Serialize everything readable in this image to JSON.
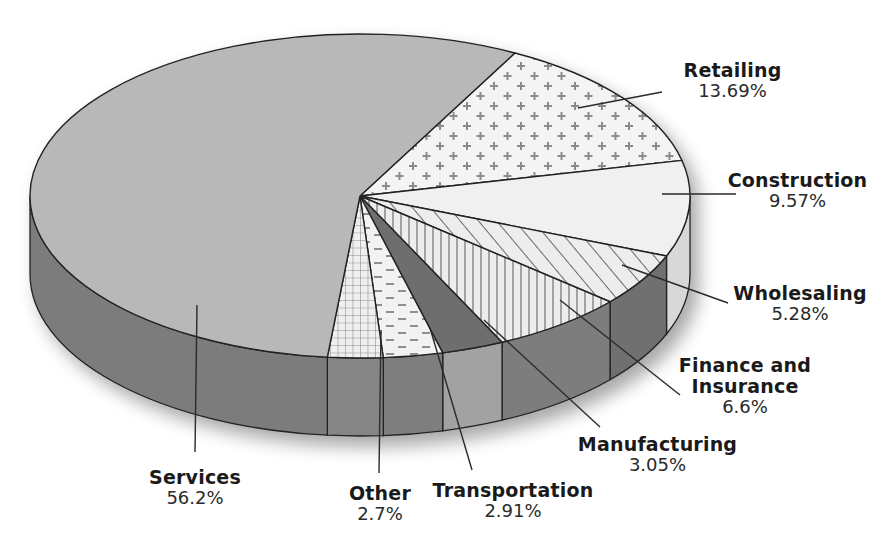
{
  "chart_data": {
    "type": "pie",
    "style": "3d",
    "title": "",
    "categories": [
      "Services",
      "Retailing",
      "Construction",
      "Wholesaling",
      "Finance and Insurance",
      "Manufacturing",
      "Transportation",
      "Other"
    ],
    "values": [
      56.2,
      13.69,
      9.57,
      5.28,
      6.6,
      3.05,
      2.91,
      2.7
    ],
    "value_labels": [
      "56.2%",
      "13.69%",
      "9.57%",
      "5.28%",
      "6.6%",
      "3.05%",
      "2.91%",
      "2.7%"
    ],
    "legend": "none (callout labels)",
    "patterns": {
      "Services": "solid-gray",
      "Retailing": "plus-signs",
      "Construction": "solid-light",
      "Wholesaling": "diagonal-hatch",
      "Finance and Insurance": "vertical-lines",
      "Manufacturing": "solid-dark",
      "Transportation": "dashes",
      "Other": "grid"
    },
    "colors": {
      "services_top": "#b8b8b8",
      "side_dark": "#7a7a7a",
      "light_fill": "#f0f0f0",
      "pattern_ink": "#8a8a8a",
      "manufacturing_top": "#6e6e6e",
      "outline": "#222222"
    }
  },
  "labels": {
    "services": {
      "name": "Services",
      "value": "56.2%"
    },
    "retailing": {
      "name": "Retailing",
      "value": "13.69%"
    },
    "construction": {
      "name": "Construction",
      "value": "9.57%"
    },
    "wholesaling": {
      "name": "Wholesaling",
      "value": "5.28%"
    },
    "finance_line1": "Finance and",
    "finance_line2": "Insurance",
    "finance_value": "6.6%",
    "manufacturing": {
      "name": "Manufacturing",
      "value": "3.05%"
    },
    "transportation": {
      "name": "Transportation",
      "value": "2.91%"
    },
    "other": {
      "name": "Other",
      "value": "2.7%"
    }
  }
}
